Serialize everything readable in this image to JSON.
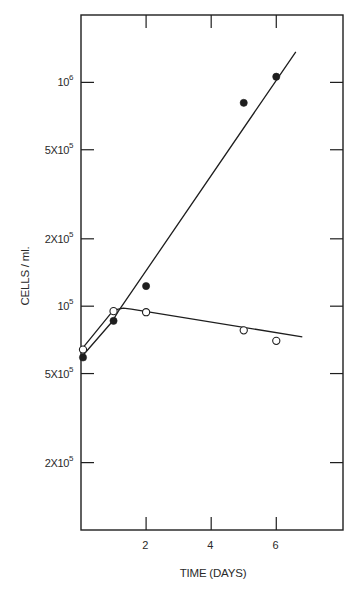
{
  "chart_data": {
    "type": "scatter",
    "title": "",
    "xlabel": "TIME (DAYS)",
    "ylabel": "CELLS / ml.",
    "xscale": "linear",
    "yscale": "log",
    "xlim": [
      0,
      8.05
    ],
    "ylim": [
      10000,
      2000000
    ],
    "grid": false,
    "legend": null,
    "x_ticks": [
      {
        "value": 2,
        "label": "2"
      },
      {
        "value": 4,
        "label": "4"
      },
      {
        "value": 6,
        "label": "6"
      }
    ],
    "y_ticks": [
      {
        "value": 1000000,
        "label": "10",
        "sup": "6"
      },
      {
        "value": 500000,
        "label": "5X10",
        "sup": "5"
      },
      {
        "value": 200000,
        "label": "2X10",
        "sup": "5"
      },
      {
        "value": 100000,
        "label": "10",
        "sup": "5"
      },
      {
        "value": 50000,
        "label": "5X10",
        "sup": "5"
      },
      {
        "value": 20000,
        "label": "2X10",
        "sup": "5"
      }
    ],
    "series": [
      {
        "name": "filled circles",
        "marker": "filled-circle",
        "x": [
          0,
          1,
          2,
          5,
          6
        ],
        "y": [
          59000,
          86000,
          123000,
          810000,
          1060000
        ],
        "curve": [
          [
            0.05,
            60000
          ],
          [
            0.95,
            85000
          ],
          [
            1.15,
            95000
          ],
          [
            6.6,
            1370000
          ]
        ]
      },
      {
        "name": "open circles",
        "marker": "open-circle",
        "x": [
          0,
          1,
          2,
          5,
          6
        ],
        "y": [
          64000,
          95000,
          94000,
          78000,
          70000
        ],
        "curve": [
          [
            0.05,
            65000
          ],
          [
            1.0,
            96000
          ],
          [
            1.3,
            98000
          ],
          [
            1.55,
            97000
          ],
          [
            6.8,
            73000
          ]
        ]
      }
    ]
  },
  "colors": {
    "ink": "#1e1e1e",
    "background": "#ffffff"
  }
}
